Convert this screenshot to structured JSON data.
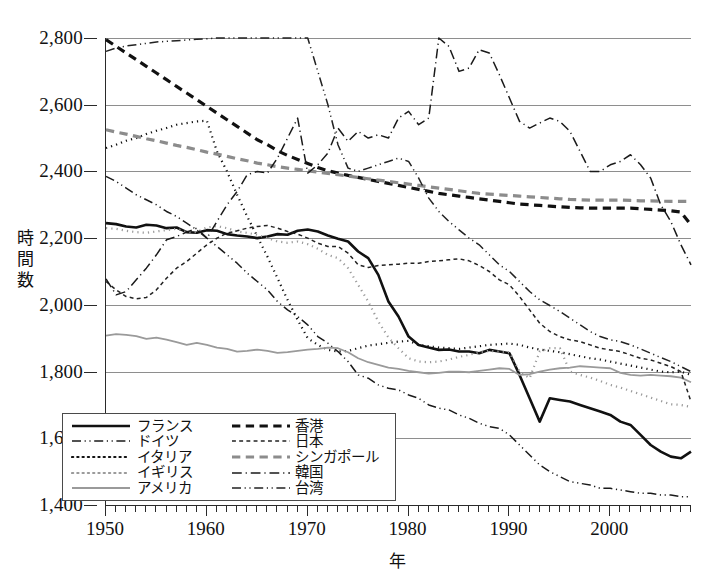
{
  "chart_data": {
    "type": "line",
    "title": "",
    "xlabel": "年",
    "ylabel": "時間数",
    "xlim": [
      1950,
      2008
    ],
    "ylim": [
      1400,
      2800
    ],
    "ytick_labels": [
      "2,800",
      "2,600",
      "2,400",
      "2,200",
      "2,000",
      "1,800",
      "1,600",
      "1,400"
    ],
    "ytick_values": [
      2800,
      2600,
      2400,
      2200,
      2000,
      1800,
      1600,
      1400
    ],
    "xtick_labels": [
      "1950",
      "1960",
      "1970",
      "1980",
      "1990",
      "2000"
    ],
    "xtick_values": [
      1950,
      1960,
      1970,
      1980,
      1990,
      2000
    ],
    "minor_xtick_step": 1,
    "grid": "horizontal",
    "legend_position": "lower-left-inside",
    "x": [
      1950,
      1951,
      1952,
      1953,
      1954,
      1955,
      1956,
      1957,
      1958,
      1959,
      1960,
      1961,
      1962,
      1963,
      1964,
      1965,
      1966,
      1967,
      1968,
      1969,
      1970,
      1971,
      1972,
      1973,
      1974,
      1975,
      1976,
      1977,
      1978,
      1979,
      1980,
      1981,
      1982,
      1983,
      1984,
      1985,
      1986,
      1987,
      1988,
      1989,
      1990,
      1991,
      1992,
      1993,
      1994,
      1995,
      1996,
      1997,
      1998,
      1999,
      2000,
      2001,
      2002,
      2003,
      2004,
      2005,
      2006,
      2007,
      2008
    ],
    "series": [
      {
        "name": "フランス",
        "key": "france",
        "color": "#111111",
        "width": 2.6,
        "dash": "none",
        "values": [
          2245,
          2242,
          2235,
          2232,
          2240,
          2238,
          2230,
          2232,
          2218,
          2216,
          2224,
          2222,
          2212,
          2208,
          2205,
          2200,
          2205,
          2212,
          2210,
          2222,
          2226,
          2220,
          2208,
          2198,
          2190,
          2160,
          2140,
          2090,
          2010,
          1965,
          1905,
          1880,
          1872,
          1865,
          1866,
          1860,
          1860,
          1855,
          1865,
          1860,
          1855,
          1790,
          1720,
          1650,
          1720,
          1715,
          1710,
          1700,
          1690,
          1680,
          1670,
          1650,
          1640,
          1610,
          1580,
          1560,
          1545,
          1540,
          1560
        ]
      },
      {
        "name": "ドイツ",
        "key": "germany",
        "color": "#1a1a1a",
        "width": 1.5,
        "dash": "dash-dot-dot",
        "values": [
          2385,
          2370,
          2350,
          2330,
          2315,
          2300,
          2280,
          2265,
          2245,
          2225,
          2200,
          2175,
          2150,
          2125,
          2095,
          2070,
          2045,
          2010,
          1985,
          1965,
          1940,
          1905,
          1885,
          1860,
          1830,
          1790,
          1780,
          1760,
          1750,
          1745,
          1730,
          1720,
          1700,
          1690,
          1685,
          1670,
          1660,
          1645,
          1635,
          1630,
          1610,
          1580,
          1550,
          1520,
          1500,
          1485,
          1470,
          1465,
          1460,
          1450,
          1450,
          1445,
          1440,
          1435,
          1435,
          1430,
          1430,
          1425,
          1425
        ]
      },
      {
        "name": "イタリア",
        "key": "italy",
        "color": "#111111",
        "width": 2.2,
        "dash": "dotted",
        "values": [
          2470,
          2480,
          2492,
          2500,
          2512,
          2522,
          2530,
          2540,
          2545,
          2550,
          2552,
          2460,
          2400,
          2330,
          2265,
          2205,
          2145,
          2080,
          2015,
          1955,
          1900,
          1880,
          1865,
          1860,
          1862,
          1870,
          1878,
          1882,
          1886,
          1890,
          1892,
          1880,
          1876,
          1872,
          1870,
          1868,
          1872,
          1876,
          1880,
          1882,
          1884,
          1880,
          1872,
          1866,
          1862,
          1858,
          1852,
          1846,
          1840,
          1836,
          1830,
          1824,
          1818,
          1812,
          1806,
          1800,
          1798,
          1800,
          1790
        ]
      },
      {
        "name": "イギリス",
        "key": "uk",
        "color": "#9a9a9a",
        "width": 2.2,
        "dash": "dotted",
        "values": [
          2230,
          2228,
          2222,
          2218,
          2216,
          2220,
          2224,
          2228,
          2218,
          2218,
          2232,
          2236,
          2230,
          2220,
          2216,
          2210,
          2200,
          2190,
          2186,
          2190,
          2182,
          2168,
          2150,
          2140,
          2110,
          2060,
          2010,
          1950,
          1902,
          1870,
          1840,
          1830,
          1828,
          1830,
          1836,
          1844,
          1850,
          1858,
          1862,
          1860,
          1858,
          1800,
          1780,
          1860,
          1870,
          1870,
          1800,
          1790,
          1782,
          1772,
          1760,
          1752,
          1742,
          1732,
          1722,
          1712,
          1702,
          1700,
          1694
        ]
      },
      {
        "name": "アメリカ",
        "key": "usa",
        "color": "#9a9a9a",
        "width": 1.8,
        "dash": "none",
        "values": [
          1908,
          1912,
          1910,
          1906,
          1898,
          1902,
          1896,
          1888,
          1880,
          1886,
          1880,
          1872,
          1868,
          1860,
          1862,
          1866,
          1862,
          1856,
          1858,
          1862,
          1866,
          1868,
          1872,
          1870,
          1858,
          1840,
          1828,
          1820,
          1812,
          1808,
          1802,
          1798,
          1794,
          1796,
          1800,
          1800,
          1798,
          1802,
          1806,
          1810,
          1808,
          1790,
          1792,
          1800,
          1806,
          1810,
          1812,
          1816,
          1814,
          1812,
          1810,
          1796,
          1790,
          1788,
          1790,
          1788,
          1786,
          1782,
          1768
        ]
      },
      {
        "name": "香港",
        "key": "hongkong",
        "color": "#111111",
        "width": 3.2,
        "dash": "dashed",
        "values": [
          2795,
          2775,
          2755,
          2735,
          2715,
          2695,
          2675,
          2655,
          2635,
          2615,
          2595,
          2575,
          2555,
          2535,
          2515,
          2495,
          2480,
          2462,
          2448,
          2436,
          2424,
          2412,
          2402,
          2395,
          2388,
          2382,
          2376,
          2370,
          2364,
          2358,
          2352,
          2346,
          2340,
          2334,
          2330,
          2326,
          2322,
          2318,
          2314,
          2310,
          2306,
          2302,
          2300,
          2298,
          2296,
          2294,
          2292,
          2291,
          2290,
          2290,
          2290,
          2290,
          2290,
          2288,
          2286,
          2284,
          2282,
          2278,
          2240
        ]
      },
      {
        "name": "日本",
        "key": "japan",
        "color": "#222222",
        "width": 1.5,
        "dash": "dash-small",
        "values": [
          2070,
          2045,
          2025,
          2018,
          2022,
          2045,
          2080,
          2110,
          2130,
          2155,
          2180,
          2200,
          2215,
          2222,
          2230,
          2235,
          2238,
          2230,
          2220,
          2212,
          2200,
          2185,
          2175,
          2175,
          2155,
          2120,
          2112,
          2118,
          2120,
          2122,
          2125,
          2125,
          2130,
          2132,
          2135,
          2138,
          2132,
          2118,
          2100,
          2075,
          2060,
          2025,
          1985,
          1945,
          1920,
          1905,
          1895,
          1890,
          1880,
          1870,
          1865,
          1860,
          1850,
          1840,
          1835,
          1825,
          1815,
          1800,
          1710
        ]
      },
      {
        "name": "シンガポール",
        "key": "singapore",
        "color": "#8c8c8c",
        "width": 3.2,
        "dash": "dashed",
        "values": [
          2525,
          2518,
          2512,
          2505,
          2498,
          2492,
          2485,
          2478,
          2472,
          2465,
          2458,
          2452,
          2445,
          2438,
          2432,
          2425,
          2420,
          2414,
          2410,
          2406,
          2402,
          2398,
          2394,
          2390,
          2386,
          2382,
          2378,
          2374,
          2370,
          2366,
          2362,
          2358,
          2354,
          2350,
          2346,
          2342,
          2338,
          2334,
          2332,
          2330,
          2328,
          2326,
          2324,
          2322,
          2320,
          2318,
          2316,
          2315,
          2314,
          2314,
          2314,
          2314,
          2313,
          2312,
          2312,
          2311,
          2310,
          2310,
          2310
        ]
      },
      {
        "name": "韓国",
        "key": "korea",
        "color": "#1a1a1a",
        "width": 1.5,
        "dash": "dash-dot",
        "values": [
          2078,
          2030,
          2040,
          2075,
          2110,
          2150,
          2195,
          2205,
          2218,
          2230,
          2200,
          2250,
          2300,
          2340,
          2390,
          2400,
          2395,
          2440,
          2500,
          2560,
          2395,
          2420,
          2455,
          2530,
          2490,
          2520,
          2500,
          2510,
          2500,
          2560,
          2580,
          2540,
          2560,
          2800,
          2775,
          2700,
          2710,
          2765,
          2755,
          2690,
          2620,
          2550,
          2530,
          2545,
          2560,
          2550,
          2520,
          2460,
          2400,
          2400,
          2420,
          2430,
          2450,
          2420,
          2380,
          2300,
          2250,
          2180,
          2120
        ]
      },
      {
        "name": "台湾",
        "key": "taiwan",
        "color": "#222222",
        "width": 1.5,
        "dash": "dash-dot-dot",
        "values": [
          2760,
          2770,
          2776,
          2780,
          2784,
          2788,
          2790,
          2792,
          2794,
          2796,
          2798,
          2800,
          2800,
          2800,
          2800,
          2800,
          2800,
          2800,
          2800,
          2800,
          2800,
          2700,
          2600,
          2480,
          2410,
          2400,
          2410,
          2420,
          2430,
          2440,
          2430,
          2380,
          2320,
          2280,
          2250,
          2225,
          2200,
          2180,
          2150,
          2120,
          2100,
          2070,
          2040,
          2015,
          1998,
          1980,
          1960,
          1940,
          1920,
          1905,
          1895,
          1890,
          1880,
          1868,
          1855,
          1842,
          1830,
          1815,
          1800
        ]
      }
    ]
  },
  "legend": {
    "rows": [
      {
        "left": {
          "key": "france",
          "label": "フランス"
        },
        "right": {
          "key": "hongkong",
          "label": "香港"
        }
      },
      {
        "left": {
          "key": "germany",
          "label": "ドイツ"
        },
        "right": {
          "key": "japan",
          "label": "日本"
        }
      },
      {
        "left": {
          "key": "italy",
          "label": "イタリア"
        },
        "right": {
          "key": "singapore",
          "label": "シンガポール"
        }
      },
      {
        "left": {
          "key": "uk",
          "label": "イギリス"
        },
        "right": {
          "key": "korea",
          "label": "韓国"
        }
      },
      {
        "left": {
          "key": "usa",
          "label": "アメリカ"
        },
        "right": {
          "key": "taiwan",
          "label": "台湾"
        }
      }
    ]
  },
  "colors": {
    "ink": "#111111",
    "grid": "#8e8e8e",
    "grey_series": "#9a9a9a",
    "background": "#ffffff"
  }
}
